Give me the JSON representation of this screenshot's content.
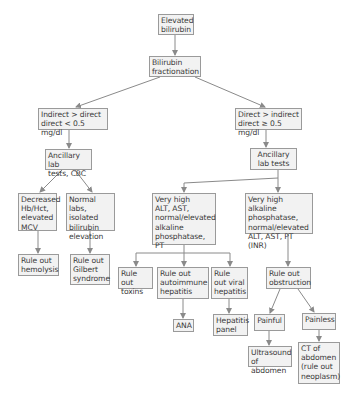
{
  "diagram": {
    "colors": {
      "box_fill": "#f2f2f2",
      "box_border": "#9a9a9a",
      "text": "#3a3a3a",
      "edge": "#8a8a8a"
    },
    "nodes": {
      "elevated": {
        "label": "Elevated\nbilirubin"
      },
      "fractionation": {
        "label": "Bilirubin\nfractionation"
      },
      "indirect": {
        "label": "Indirect > direct\ndirect < 0.5 mg/dl"
      },
      "direct": {
        "label": "Direct > indirect\ndirect ≥ 0.5 mg/dl"
      },
      "ancillary_cbc": {
        "label": "Ancillary lab\ntests, CBC"
      },
      "ancillary": {
        "label": "Ancillary\nlab tests"
      },
      "decreased_hb": {
        "label": "Decreased\nHb/Hct,\nelevated\nMCV"
      },
      "normal_labs": {
        "label": "Normal labs,\nisolated\nbilirubin\nelevation"
      },
      "very_high_alt": {
        "label": "Very high\nALT, AST,\nnormal/elevated\nalkaline\nphosphatase, PT"
      },
      "very_high_alk": {
        "label": "Very high alkaline\nphosphatase,\nnormal/elevated\nALT, AST, PT (INR)"
      },
      "hemolysis": {
        "label": "Rule out\nhemolysis"
      },
      "gilbert": {
        "label": "Rule out\nGilbert\nsyndrome"
      },
      "toxins": {
        "label": "Rule out\ntoxins"
      },
      "autoimmune": {
        "label": "Rule out\nautoimmune\nhepatitis"
      },
      "viral": {
        "label": "Rule\nout viral\nhepatitis"
      },
      "obstruction": {
        "label": "Rule out\nobstruction"
      },
      "ana": {
        "label": "ANA"
      },
      "hep_panel": {
        "label": "Hepatitis\npanel"
      },
      "painful": {
        "label": "Painful"
      },
      "painless": {
        "label": "Painless"
      },
      "ultrasound": {
        "label": "Ultrasound\nof abdomen"
      },
      "ct": {
        "label": "CT of\nabdomen\n(rule out\nneoplasm)"
      }
    },
    "edges": [
      [
        "elevated",
        "fractionation"
      ],
      [
        "fractionation",
        "indirect"
      ],
      [
        "fractionation",
        "direct"
      ],
      [
        "indirect",
        "ancillary_cbc"
      ],
      [
        "direct",
        "ancillary"
      ],
      [
        "ancillary_cbc",
        "decreased_hb"
      ],
      [
        "ancillary_cbc",
        "normal_labs"
      ],
      [
        "ancillary",
        "very_high_alt"
      ],
      [
        "ancillary",
        "very_high_alk"
      ],
      [
        "decreased_hb",
        "hemolysis"
      ],
      [
        "normal_labs",
        "gilbert"
      ],
      [
        "very_high_alt",
        "toxins"
      ],
      [
        "very_high_alt",
        "autoimmune"
      ],
      [
        "very_high_alt",
        "viral"
      ],
      [
        "very_high_alk",
        "obstruction"
      ],
      [
        "autoimmune",
        "ana"
      ],
      [
        "viral",
        "hep_panel"
      ],
      [
        "obstruction",
        "painful"
      ],
      [
        "obstruction",
        "painless"
      ],
      [
        "painful",
        "ultrasound"
      ],
      [
        "painless",
        "ct"
      ]
    ]
  }
}
